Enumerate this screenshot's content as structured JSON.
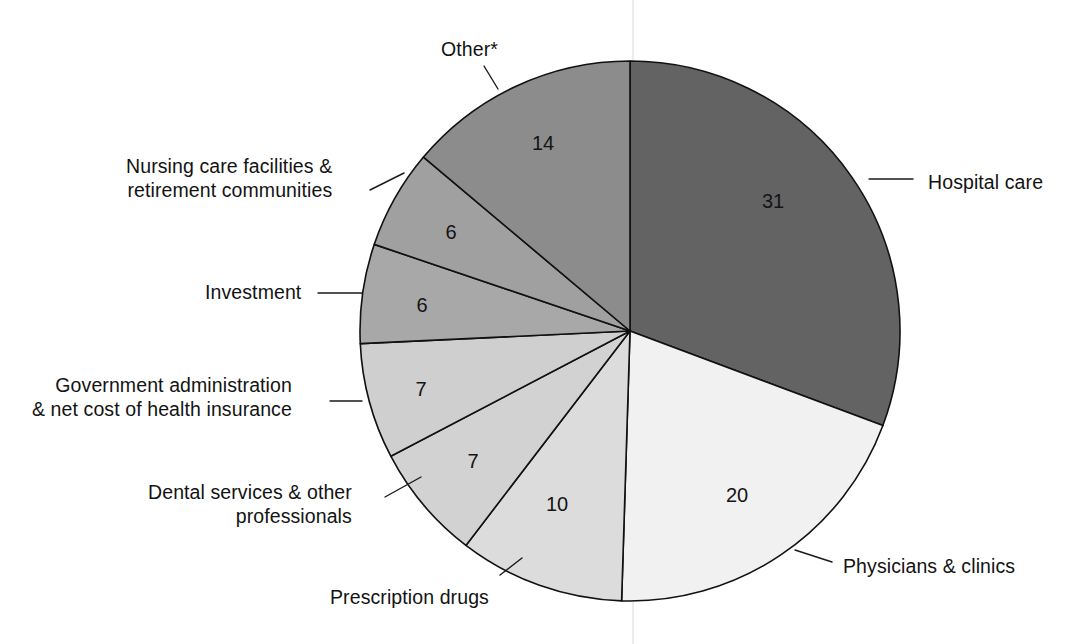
{
  "figure": {
    "type": "pie-chart",
    "background_color": "#ffffff",
    "center": {
      "x": 630,
      "y": 331
    },
    "radius": 270,
    "start_angle_deg": 0,
    "direction": "clockwise"
  },
  "chart_data": {
    "type": "pie",
    "title": "",
    "subtitle": "",
    "xlabel": "",
    "ylabel": "",
    "units": "percent",
    "legend_position": "callout-labels",
    "grid": false,
    "footnote_marker": "*",
    "categories": [
      "Hospital care",
      "Physicians & clinics",
      "Prescription drugs",
      "Dental services & other professionals",
      "Government administration & net cost of health insurance",
      "Investment",
      "Nursing care facilities & retirement communities",
      "Other*"
    ],
    "values": [
      31,
      20,
      10,
      7,
      7,
      6,
      6,
      14
    ],
    "value_labels": [
      "31",
      "20",
      "10",
      "7",
      "7",
      "6",
      "6",
      "14"
    ],
    "total": 101,
    "colors": [
      "#636363",
      "#f1f1f1",
      "#dcdcdc",
      "#d2d2d2",
      "#cfcfcf",
      "#a8a8a8",
      "#a0a0a0",
      "#8c8c8c"
    ],
    "slices": [
      {
        "name": "Hospital care",
        "value": 31,
        "value_label": "31",
        "color": "#636363",
        "label_text": "Hospital care",
        "label_align": "right",
        "label_x": 928,
        "label_y": 171,
        "value_x": 773,
        "value_y": 203,
        "leader": {
          "x1": 869,
          "y1": 179,
          "x2": 913,
          "y2": 179
        }
      },
      {
        "name": "Physicians & clinics",
        "value": 20,
        "value_label": "20",
        "color": "#f1f1f1",
        "label_text": "Physicians & clinics",
        "label_align": "right",
        "label_x": 843,
        "label_y": 555,
        "value_x": 737,
        "value_y": 497,
        "leader": {
          "x1": 795,
          "y1": 550,
          "x2": 832,
          "y2": 562
        }
      },
      {
        "name": "Prescription drugs",
        "value": 10,
        "value_label": "10",
        "color": "#dcdcdc",
        "label_text": "Prescription drugs",
        "label_align": "left",
        "label_x": 330,
        "label_y": 586,
        "value_x": 557,
        "value_y": 506,
        "leader": {
          "x1": 500,
          "y1": 575,
          "x2": 522,
          "y2": 558
        }
      },
      {
        "name": "Dental services & other professionals",
        "value": 7,
        "value_label": "7",
        "color": "#d2d2d2",
        "label_text": "Dental services & other\nprofessionals",
        "label_align": "left",
        "label_x": 148,
        "label_y": 481,
        "value_x": 473,
        "value_y": 463,
        "leader": {
          "x1": 385,
          "y1": 497,
          "x2": 421,
          "y2": 477
        }
      },
      {
        "name": "Government administration & net cost of health insurance",
        "value": 7,
        "value_label": "7",
        "color": "#cfcfcf",
        "label_text": "Government administration\n& net cost of health insurance",
        "label_align": "left",
        "label_x": 32,
        "label_y": 374,
        "value_x": 421,
        "value_y": 391,
        "leader": {
          "x1": 330,
          "y1": 401,
          "x2": 362,
          "y2": 401
        }
      },
      {
        "name": "Investment",
        "value": 6,
        "value_label": "6",
        "color": "#a8a8a8",
        "label_text": "Investment",
        "label_align": "left",
        "label_x": 205,
        "label_y": 281,
        "value_x": 422,
        "value_y": 307,
        "leader": {
          "x1": 318,
          "y1": 293,
          "x2": 362,
          "y2": 293
        }
      },
      {
        "name": "Nursing care facilities & retirement communities",
        "value": 6,
        "value_label": "6",
        "color": "#a0a0a0",
        "label_text": "Nursing care facilities &\nretirement communities",
        "label_align": "left",
        "label_x": 126,
        "label_y": 155,
        "value_x": 451,
        "value_y": 234,
        "leader": {
          "x1": 370,
          "y1": 190,
          "x2": 404,
          "y2": 173
        }
      },
      {
        "name": "Other*",
        "value": 14,
        "value_label": "14",
        "color": "#8c8c8c",
        "label_text": "Other*",
        "label_align": "left",
        "label_x": 441,
        "label_y": 38,
        "value_x": 543,
        "value_y": 145,
        "leader": {
          "x1": 484,
          "y1": 66,
          "x2": 498,
          "y2": 89
        }
      }
    ]
  }
}
